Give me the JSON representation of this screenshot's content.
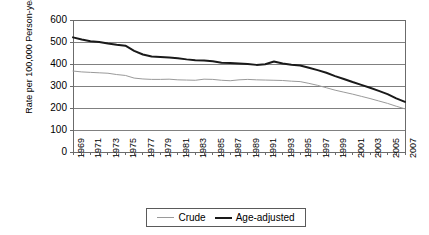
{
  "chart_data": {
    "type": "line",
    "title": "",
    "xlabel": "",
    "ylabel": "Rate per 100,000 Person-years",
    "ylim": [
      0,
      600
    ],
    "ytick_values": [
      0,
      100,
      200,
      300,
      400,
      500,
      600
    ],
    "ytick_labels": [
      "0",
      "100",
      "200",
      "300",
      "400",
      "500",
      "600"
    ],
    "xlim": [
      1969,
      2007
    ],
    "grid": "horizontal",
    "legend_position": "bottom-center",
    "x": [
      1969,
      1970,
      1971,
      1972,
      1973,
      1974,
      1975,
      1976,
      1977,
      1978,
      1979,
      1980,
      1981,
      1982,
      1983,
      1984,
      1985,
      1986,
      1987,
      1988,
      1989,
      1990,
      1991,
      1992,
      1993,
      1994,
      1995,
      1996,
      1997,
      1998,
      1999,
      2000,
      2001,
      2002,
      2003,
      2004,
      2005,
      2006,
      2007
    ],
    "xtick_labels": [
      "1969",
      "1971",
      "1973",
      "1975",
      "1977",
      "1979",
      "1981",
      "1983",
      "1985",
      "1987",
      "1989",
      "1991",
      "1993",
      "1995",
      "1997",
      "1999",
      "2001",
      "2003",
      "2005",
      "2007"
    ],
    "xtick_label_years": [
      1969,
      1971,
      1973,
      1975,
      1977,
      1979,
      1981,
      1983,
      1985,
      1987,
      1989,
      1991,
      1993,
      1995,
      1997,
      1999,
      2001,
      2003,
      2005,
      2007
    ],
    "series": [
      {
        "name": "Crude",
        "color": "#9a9a9a",
        "line_width": 1,
        "values": [
          368,
          364,
          362,
          360,
          358,
          352,
          348,
          336,
          332,
          330,
          330,
          331,
          328,
          327,
          326,
          331,
          330,
          326,
          324,
          328,
          330,
          328,
          327,
          326,
          325,
          322,
          320,
          312,
          303,
          292,
          281,
          272,
          263,
          253,
          243,
          232,
          221,
          208,
          196
        ]
      },
      {
        "name": "Age-adjusted",
        "color": "#1a1a1a",
        "line_width": 2,
        "values": [
          521,
          511,
          503,
          500,
          493,
          487,
          483,
          460,
          443,
          434,
          432,
          429,
          426,
          421,
          417,
          416,
          412,
          406,
          404,
          402,
          400,
          396,
          399,
          411,
          402,
          397,
          393,
          383,
          372,
          360,
          345,
          332,
          318,
          305,
          292,
          278,
          263,
          244,
          228
        ]
      }
    ],
    "legend": [
      {
        "label": "Crude",
        "marker": "line-thin-gray"
      },
      {
        "label": "Age-adjusted",
        "marker": "line-thick-black"
      }
    ]
  }
}
